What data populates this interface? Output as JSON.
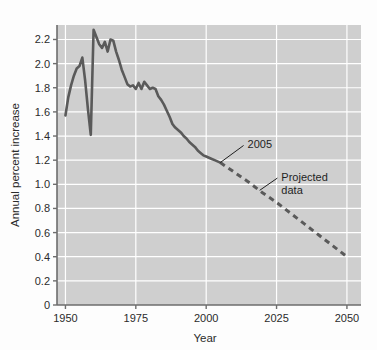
{
  "figure": {
    "background": "#fdfdfd",
    "plot_background": "#cfcfcf",
    "grid_color": "#ffffff",
    "axis_color": "#6d6d6d",
    "line_color": "#5a5a5a",
    "text_color": "#2b2b2b"
  },
  "chart_data": {
    "type": "line",
    "title": "",
    "xlabel": "Year",
    "ylabel": "Annual percent increase",
    "xlim": [
      1947,
      2055
    ],
    "ylim": [
      0,
      2.32
    ],
    "grid": true,
    "legend_position": "none",
    "xticks": [
      1950,
      1975,
      2000,
      2025,
      2050
    ],
    "xtick_labels": [
      "1950",
      "1975",
      "2000",
      "2025",
      "2050"
    ],
    "yticks": [
      0,
      0.2,
      0.4,
      0.6,
      0.8,
      1.0,
      1.2,
      1.4,
      1.6,
      1.8,
      2.0,
      2.2
    ],
    "ytick_labels": [
      "0",
      "0.2",
      "0.4",
      "0.6",
      "0.8",
      "1.0",
      "1.2",
      "1.4",
      "1.6",
      "1.8",
      "2.0",
      "2.2"
    ],
    "series": [
      {
        "name": "Historical data",
        "style": "solid",
        "color": "#5a5a5a",
        "x": [
          1950,
          1951,
          1952,
          1953,
          1954,
          1955,
          1956,
          1957,
          1958,
          1959,
          1960,
          1961,
          1962,
          1963,
          1964,
          1965,
          1966,
          1967,
          1968,
          1969,
          1970,
          1971,
          1972,
          1973,
          1974,
          1975,
          1976,
          1977,
          1978,
          1979,
          1980,
          1981,
          1982,
          1983,
          1984,
          1985,
          1986,
          1987,
          1988,
          1989,
          1990,
          1991,
          1992,
          1993,
          1994,
          1995,
          1996,
          1997,
          1998,
          1999,
          2000,
          2001,
          2002,
          2003,
          2004,
          2005
        ],
        "y": [
          1.57,
          1.72,
          1.82,
          1.9,
          1.96,
          1.98,
          2.05,
          1.86,
          1.62,
          1.41,
          2.28,
          2.22,
          2.16,
          2.13,
          2.18,
          2.1,
          2.2,
          2.19,
          2.1,
          2.03,
          1.95,
          1.89,
          1.83,
          1.81,
          1.82,
          1.79,
          1.84,
          1.79,
          1.85,
          1.82,
          1.79,
          1.8,
          1.79,
          1.73,
          1.7,
          1.66,
          1.61,
          1.56,
          1.5,
          1.47,
          1.45,
          1.43,
          1.4,
          1.38,
          1.35,
          1.33,
          1.31,
          1.28,
          1.26,
          1.24,
          1.23,
          1.22,
          1.21,
          1.2,
          1.19,
          1.18
        ]
      },
      {
        "name": "Projected data",
        "style": "dashed",
        "color": "#5a5a5a",
        "x": [
          2005,
          2010,
          2015,
          2020,
          2025,
          2030,
          2035,
          2040,
          2045,
          2050
        ],
        "y": [
          1.18,
          1.1,
          1.02,
          0.93,
          0.85,
          0.76,
          0.67,
          0.58,
          0.49,
          0.4
        ]
      }
    ],
    "annotations": [
      {
        "label": "2005",
        "label_lines": [
          "2005"
        ],
        "point_x": 2005,
        "point_y": 1.18,
        "text_x": 2014,
        "text_y": 1.33
      },
      {
        "label": "Projected data",
        "label_lines": [
          "Projected",
          "data"
        ],
        "point_x": 2019,
        "point_y": 0.95,
        "text_x": 2026,
        "text_y": 1.06
      }
    ]
  }
}
